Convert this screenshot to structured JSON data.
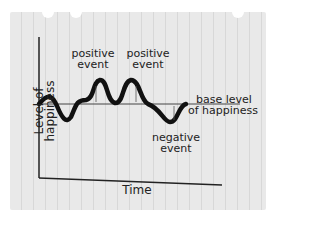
{
  "diagram": {
    "type": "hand-drawn line graph on notebook paper",
    "y_axis_label": "Level of happiness",
    "x_axis_label": "Time",
    "annotations": {
      "positive_event_1": [
        "positive",
        "event"
      ],
      "positive_event_2": [
        "positive",
        "event"
      ],
      "negative_event": [
        "negative",
        "event"
      ],
      "baseline": [
        "base level",
        "of happiness"
      ]
    }
  }
}
